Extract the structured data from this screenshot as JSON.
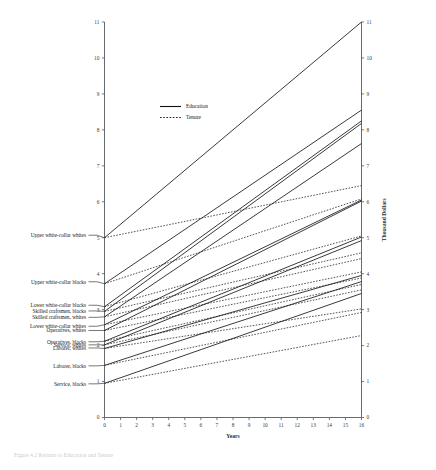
{
  "figure": {
    "caption": "Figure 4.2 Returns to Education and Tenure"
  },
  "legend": {
    "position": "upper-left-inside",
    "entries": [
      {
        "label": "Education",
        "style": "solid"
      },
      {
        "label": "Tenure",
        "style": "dashed"
      }
    ]
  },
  "chart_data": {
    "type": "line",
    "title": "",
    "subtitle": "",
    "xlabel": "Years",
    "ylabel": "Thousand Dollars",
    "xlim": [
      0,
      16
    ],
    "ylim": [
      0,
      11
    ],
    "grid": false,
    "legend_position": "upper left",
    "x_ticks": [
      0,
      1,
      2,
      3,
      4,
      5,
      6,
      7,
      8,
      9,
      10,
      11,
      12,
      13,
      14,
      15,
      16
    ],
    "y_ticks_left": [
      0,
      1,
      2,
      3,
      4,
      5,
      6,
      7,
      8,
      9,
      10,
      11
    ],
    "y_ticks_right": [
      0,
      1,
      2,
      3,
      4,
      5,
      6,
      7,
      8,
      9,
      10,
      11
    ],
    "x": [
      0,
      16
    ],
    "series": [
      {
        "name": "Upper white-collar whites",
        "style": "solid",
        "legend_group": "Education",
        "values": [
          5.0,
          11.0
        ]
      },
      {
        "name": "Upper white-collar whites",
        "style": "dashed",
        "legend_group": "Tenure",
        "values": [
          5.0,
          6.45
        ]
      },
      {
        "name": "Upper white-collar blacks",
        "style": "solid",
        "legend_group": "Education",
        "values": [
          3.72,
          8.55
        ]
      },
      {
        "name": "Upper white-collar blacks",
        "style": "dashed",
        "legend_group": "Tenure",
        "values": [
          3.72,
          6.08
        ]
      },
      {
        "name": "Lower white-collar blacks",
        "style": "solid",
        "legend_group": "Education",
        "values": [
          3.08,
          8.25
        ]
      },
      {
        "name": "Lower white-collar blacks",
        "style": "dashed",
        "legend_group": "Tenure",
        "values": [
          3.08,
          5.05
        ]
      },
      {
        "name": "Skilled craftsmen, blacks",
        "style": "solid",
        "legend_group": "Education",
        "values": [
          2.95,
          8.18
        ]
      },
      {
        "name": "Skilled craftsmen, blacks",
        "style": "dashed",
        "legend_group": "Tenure",
        "values": [
          2.95,
          4.58
        ]
      },
      {
        "name": "Skilled craftsmen, whites",
        "style": "solid",
        "legend_group": "Education",
        "values": [
          2.8,
          7.62
        ]
      },
      {
        "name": "Skilled craftsmen, whites",
        "style": "dashed",
        "legend_group": "Tenure",
        "values": [
          2.8,
          4.42
        ]
      },
      {
        "name": "Lower white-collar whites",
        "style": "solid",
        "legend_group": "Education",
        "values": [
          2.58,
          6.05
        ]
      },
      {
        "name": "Lower white-collar whites",
        "style": "dashed",
        "legend_group": "Tenure",
        "values": [
          2.58,
          4.05
        ]
      },
      {
        "name": "Operatives, whites",
        "style": "solid",
        "legend_group": "Education",
        "values": [
          2.42,
          6.02
        ]
      },
      {
        "name": "Operatives, whites",
        "style": "dashed",
        "legend_group": "Tenure",
        "values": [
          2.42,
          3.88
        ]
      },
      {
        "name": "Operatives, blacks",
        "style": "solid",
        "legend_group": "Education",
        "values": [
          2.12,
          5.02
        ]
      },
      {
        "name": "Operatives, blacks",
        "style": "dashed",
        "legend_group": "Tenure",
        "values": [
          2.12,
          3.7
        ]
      },
      {
        "name": "Service, whites",
        "style": "solid",
        "legend_group": "Education",
        "values": [
          2.02,
          4.92
        ]
      },
      {
        "name": "Service, whites",
        "style": "dashed",
        "legend_group": "Tenure",
        "values": [
          2.02,
          3.55
        ]
      },
      {
        "name": "Laborer, whites",
        "style": "solid",
        "legend_group": "Education",
        "values": [
          1.92,
          3.95
        ]
      },
      {
        "name": "Laborer, whites",
        "style": "dashed",
        "legend_group": "Tenure",
        "values": [
          1.92,
          3.02
        ]
      },
      {
        "name": "Laborer, blacks",
        "style": "solid",
        "legend_group": "Education",
        "values": [
          1.45,
          3.78
        ]
      },
      {
        "name": "Laborer, blacks",
        "style": "dashed",
        "legend_group": "Tenure",
        "values": [
          1.45,
          2.92
        ]
      },
      {
        "name": "Service, blacks",
        "style": "solid",
        "legend_group": "Education",
        "values": [
          0.95,
          3.45
        ]
      },
      {
        "name": "Service, blacks",
        "style": "dashed",
        "legend_group": "Tenure",
        "values": [
          0.95,
          2.28
        ]
      }
    ],
    "group_labels": [
      {
        "text": "Upper white-collar whites",
        "y_value": 5.0
      },
      {
        "text": "Upper white-collar blacks",
        "y_value": 3.72
      },
      {
        "text": "Lower white-collar blacks",
        "y_value": 3.08
      },
      {
        "text": "Skilled craftsmen, blacks",
        "y_value": 2.95
      },
      {
        "text": "Skilled craftsmen, whites",
        "y_value": 2.8
      },
      {
        "text": "Lower white-collar whites",
        "y_value": 2.58
      },
      {
        "text": "Operatives, whites",
        "y_value": 2.42
      },
      {
        "text": "Operatives, blacks",
        "y_value": 2.12
      },
      {
        "text": "Service, whites",
        "y_value": 2.02
      },
      {
        "text": "Laborer, whites",
        "y_value": 1.92
      },
      {
        "text": "Laborer, blacks",
        "y_value": 1.45
      },
      {
        "text": "Service, blacks",
        "y_value": 0.95
      }
    ]
  }
}
